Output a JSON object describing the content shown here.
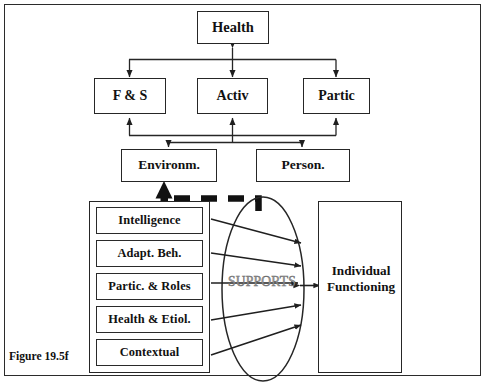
{
  "figure": {
    "caption": "Figure 19.5f",
    "border_color": "#2b2b2b",
    "background": "#ffffff",
    "line_color": "#262626",
    "supports_text_color": "#9b9b9b"
  },
  "top_tier": {
    "health": "Health"
  },
  "middle_tier": {
    "boxes": [
      {
        "label": "F & S"
      },
      {
        "label": "Activ"
      },
      {
        "label": "Partic"
      }
    ]
  },
  "lower_tier": {
    "boxes": [
      {
        "label": "Environm."
      },
      {
        "label": "Person."
      }
    ]
  },
  "domains": {
    "items": [
      {
        "label": "Intelligence"
      },
      {
        "label": "Adapt. Beh."
      },
      {
        "label": "Partic. & Roles"
      },
      {
        "label": "Health & Etiol."
      },
      {
        "label": "Contextual"
      }
    ]
  },
  "supports": {
    "label": "SUPPORTS"
  },
  "outcome": {
    "line1": "Individual",
    "line2": "Functioning"
  }
}
